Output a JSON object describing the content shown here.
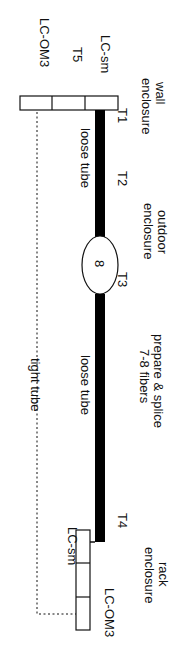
{
  "diagram": {
    "orientation": "rotated 90deg clockwise",
    "wall": {
      "title_line1": "wall",
      "title_line2": "enclosure",
      "port_sm": "LC-sm",
      "port_t5": "T5",
      "port_om3": "LC-OM3"
    },
    "terminals": {
      "t1": "T1",
      "t2": "T2",
      "t3": "T3",
      "t4": "T4"
    },
    "outdoor": {
      "title_line1": "outdoor",
      "title_line2": "enclosure",
      "count": "8"
    },
    "segments": {
      "loose_tube_1": "loose tube",
      "loose_tube_2": "loose tube",
      "tight_tube": "tight tube",
      "splice_line1": "prepare & splice",
      "splice_line2": "7-8 fibers"
    },
    "rack": {
      "title_line1": "rack",
      "title_line2": "enclosure",
      "port_sm": "LC-sm",
      "port_om3": "LC-OM3"
    },
    "colors": {
      "line": "#000000",
      "background": "#ffffff"
    }
  }
}
